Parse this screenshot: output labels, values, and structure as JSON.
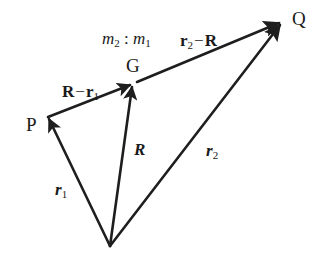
{
  "diagram": {
    "type": "vector-diagram",
    "colors": {
      "line": "#1e1e1e",
      "text": "#1a1a1a",
      "background": "#ffffff"
    },
    "points": {
      "O": {
        "label": "",
        "x": 110,
        "y": 246
      },
      "P": {
        "label": "P",
        "x": 48,
        "y": 117
      },
      "G": {
        "label": "G",
        "x": 133,
        "y": 84
      },
      "Q": {
        "label": "Q",
        "x": 282,
        "y": 22
      }
    },
    "ratio_label": {
      "a": "m",
      "a_sub": "2",
      "sep": " : ",
      "b": "m",
      "b_sub": "1"
    },
    "vectors": [
      {
        "name": "r1",
        "from": "O",
        "to": "P",
        "label_main": "r",
        "label_sub": "1",
        "style": "bold-italic"
      },
      {
        "name": "R",
        "from": "O",
        "to": "G",
        "label_main": "R",
        "label_sub": "",
        "style": "bold-italic"
      },
      {
        "name": "r2",
        "from": "O",
        "to": "Q",
        "label_main": "r",
        "label_sub": "2",
        "style": "bold-italic"
      },
      {
        "name": "R-r1",
        "from": "P",
        "to": "G",
        "label_a": "R",
        "label_op": "−",
        "label_b": "r",
        "label_b_sub": "1",
        "style": "bold"
      },
      {
        "name": "r2-R",
        "from": "G",
        "to": "Q",
        "label_a": "r",
        "label_a_sub": "2",
        "label_op": "−",
        "label_b": "R",
        "style": "bold"
      }
    ]
  }
}
